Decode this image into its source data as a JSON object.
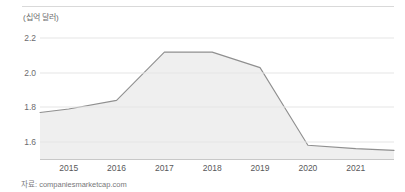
{
  "chart_data": {
    "type": "area",
    "title": "",
    "subtitle": "",
    "xlabel": "",
    "ylabel": "(십억 달러)",
    "unit_label": "(십억 달러)",
    "source_caption": "자료: companiesmarketcap.com",
    "grid": true,
    "legend": "none",
    "xlim": [
      2014.4,
      2021.8
    ],
    "ylim": [
      1.5,
      2.26
    ],
    "yticks": [
      2.2,
      2.0,
      1.8,
      1.6
    ],
    "ytick_labels": [
      "2.2",
      "2.0",
      "1.8",
      "1.6"
    ],
    "xticks": [
      2015,
      2016,
      2017,
      2018,
      2019,
      2020,
      2021
    ],
    "xtick_labels": [
      "2015",
      "2016",
      "2017",
      "2018",
      "2019",
      "2020",
      "2021"
    ],
    "categories": [
      2014.4,
      2015,
      2016,
      2017,
      2018,
      2019,
      2020,
      2021,
      2021.8
    ],
    "values": [
      1.77,
      1.79,
      1.84,
      2.12,
      2.12,
      2.03,
      1.58,
      1.56,
      1.55
    ],
    "series": [
      {
        "name": "market cap",
        "x": [
          2014.4,
          2015,
          2016,
          2017,
          2018,
          2019,
          2020,
          2021,
          2021.8
        ],
        "values": [
          1.77,
          1.79,
          1.84,
          2.12,
          2.12,
          2.03,
          1.58,
          1.56,
          1.55
        ]
      }
    ],
    "colors": {
      "line": "#8f8f8f",
      "fill": "#efefef",
      "grid": "#e6e6e6",
      "axis": "#c8c8c8",
      "text": "#58585a"
    }
  }
}
